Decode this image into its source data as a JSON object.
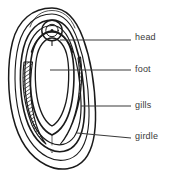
{
  "figure": {
    "kind": "anatomical-line-diagram",
    "background_color": "#ffffff",
    "ink_color": "#1a1a1a",
    "text_color": "#3a3a3a",
    "hatch_color": "#2b2b2b",
    "width": 174,
    "height": 182
  },
  "labels": [
    {
      "id": "head",
      "text": "head",
      "leader_start_x": 60,
      "leader_start_y": 40,
      "leader_end_x": 131,
      "leader_end_y": 40
    },
    {
      "id": "foot",
      "text": "foot",
      "leader_start_x": 50,
      "leader_start_y": 70,
      "leader_end_x": 131,
      "leader_end_y": 70
    },
    {
      "id": "gills",
      "text": "gills",
      "leader_start_x": 81,
      "leader_start_y": 106,
      "leader_end_x": 131,
      "leader_end_y": 106
    },
    {
      "id": "girdle",
      "text": "girdle",
      "leader_start_x": 77,
      "leader_start_y": 133,
      "leader_end_x": 131,
      "leader_end_y": 138
    }
  ],
  "parts": {
    "girdle_outer": "outermost oval body margin",
    "girdle_inner": "second oval inside the body margin",
    "mantle_groove": "narrow band between girdle and gills",
    "gill_left": "hatched gill row on the left side",
    "gill_right": "hatched gill row on the right side",
    "foot": "large central oval",
    "head": "small circle with central dot above the foot"
  }
}
